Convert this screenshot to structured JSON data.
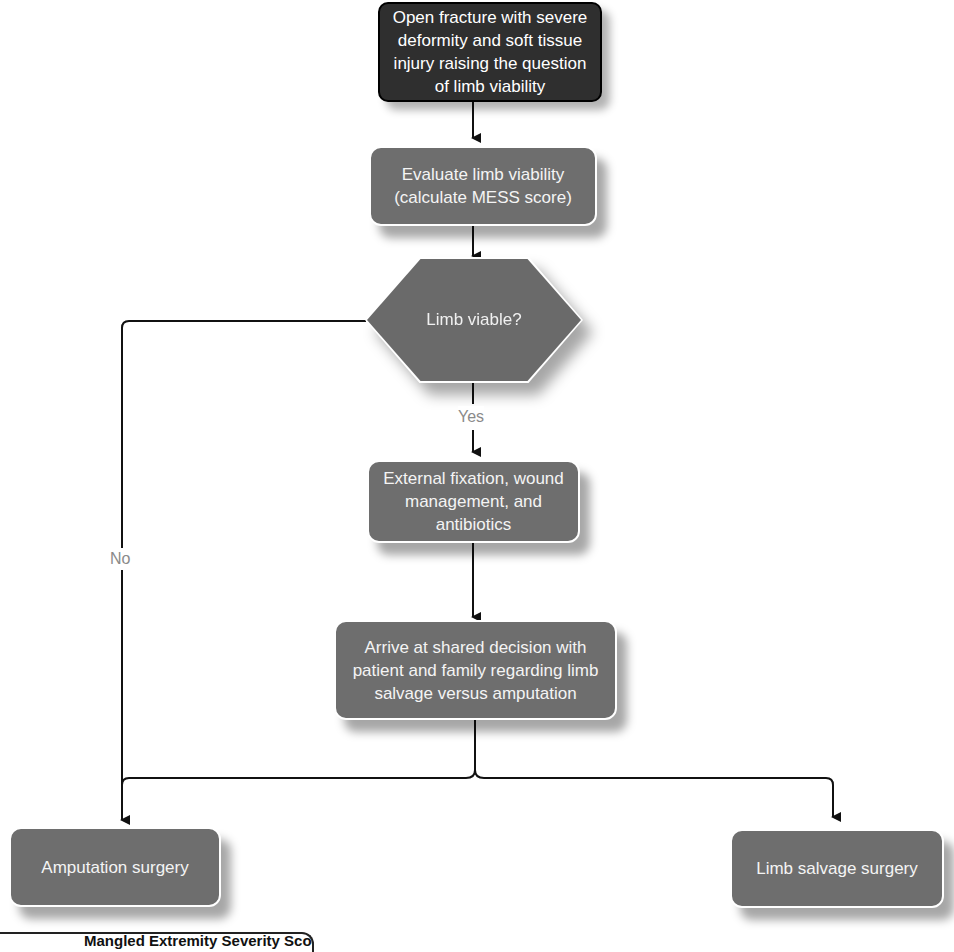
{
  "diagram": {
    "type": "flowchart",
    "nodes": {
      "start": {
        "text": "Open fracture with severe deformity and soft tissue injury raising the question of limb viability",
        "shape": "rounded-rect",
        "style": "dark"
      },
      "evaluate": {
        "text": "Evaluate limb viability (calculate MESS score)",
        "shape": "rounded-rect"
      },
      "decision": {
        "text": "Limb viable?",
        "shape": "hexagon"
      },
      "fixation": {
        "text": "External fixation, wound management, and antibiotics",
        "shape": "rounded-rect"
      },
      "shared_decision": {
        "text": "Arrive at shared decision with patient and family regarding limb salvage versus amputation",
        "shape": "rounded-rect"
      },
      "amputation": {
        "text": "Amputation surgery",
        "shape": "rounded-rect"
      },
      "salvage": {
        "text": "Limb salvage surgery",
        "shape": "rounded-rect"
      }
    },
    "edges": [
      {
        "from": "start",
        "to": "evaluate",
        "label": ""
      },
      {
        "from": "evaluate",
        "to": "decision",
        "label": ""
      },
      {
        "from": "decision",
        "to": "fixation",
        "label": "Yes"
      },
      {
        "from": "decision",
        "to": "amputation",
        "label": "No"
      },
      {
        "from": "fixation",
        "to": "shared_decision",
        "label": ""
      },
      {
        "from": "shared_decision",
        "to": "amputation",
        "label": ""
      },
      {
        "from": "shared_decision",
        "to": "salvage",
        "label": ""
      }
    ],
    "labels": {
      "yes": "Yes",
      "no": "No"
    },
    "footer_heading": "Mangled Extremity Severity Score (MESS)",
    "colors": {
      "node_fill": "#6e6e6e",
      "start_fill": "#2f2f2f",
      "text": "#f4f4f4",
      "edge": "#111111",
      "edge_label": "#8a8a8a"
    }
  }
}
